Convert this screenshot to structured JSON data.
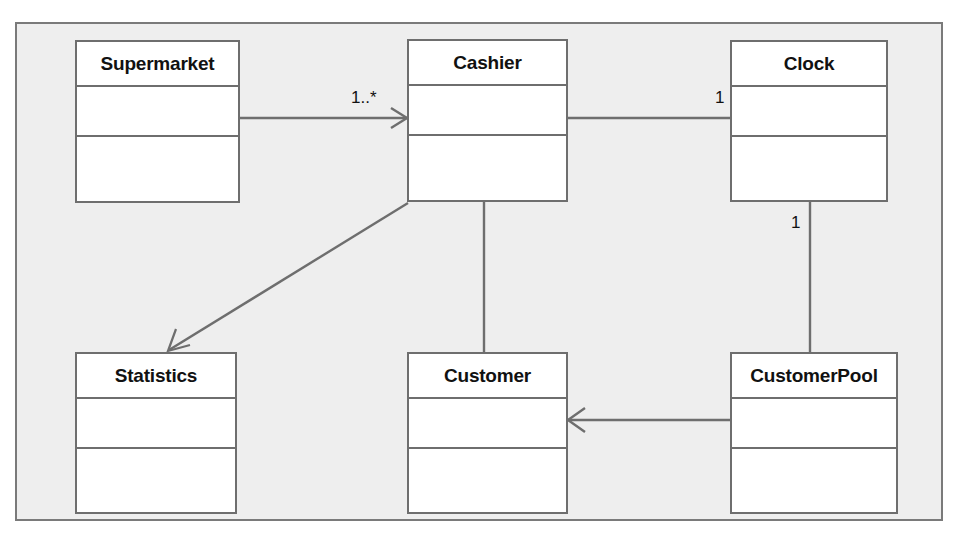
{
  "diagram": {
    "type": "uml-class-diagram",
    "frame_color": "#7a7a7a",
    "background_color": "#eeeeee",
    "box_fill_color": "#ffffff",
    "box_border_color": "#6e6e6e",
    "line_color": "#6e6e6e",
    "classes": [
      {
        "id": "supermarket",
        "name": "Supermarket",
        "attributes": [],
        "operations": []
      },
      {
        "id": "cashier",
        "name": "Cashier",
        "attributes": [],
        "operations": []
      },
      {
        "id": "clock",
        "name": "Clock",
        "attributes": [],
        "operations": []
      },
      {
        "id": "statistics",
        "name": "Statistics",
        "attributes": [],
        "operations": []
      },
      {
        "id": "customer",
        "name": "Customer",
        "attributes": [],
        "operations": []
      },
      {
        "id": "customerpool",
        "name": "CustomerPool",
        "attributes": [],
        "operations": []
      }
    ],
    "relationships": [
      {
        "id": "supermarket-cashier",
        "from": "supermarket",
        "to": "cashier",
        "arrow": "open",
        "label": "1..*"
      },
      {
        "id": "cashier-clock",
        "from": "cashier",
        "to": "clock",
        "arrow": "none",
        "label": "1"
      },
      {
        "id": "clock-customerpool",
        "from": "clock",
        "to": "customerpool",
        "arrow": "none",
        "label": "1"
      },
      {
        "id": "cashier-statistics",
        "from": "cashier",
        "to": "statistics",
        "arrow": "open",
        "label": ""
      },
      {
        "id": "cashier-customer",
        "from": "cashier",
        "to": "customer",
        "arrow": "none",
        "label": ""
      },
      {
        "id": "customerpool-customer",
        "from": "customerpool",
        "to": "customer",
        "arrow": "open",
        "label": ""
      }
    ],
    "labels": {
      "supermarket_cashier_mult": "1..*",
      "cashier_clock_mult": "1",
      "clock_customerpool_mult": "1"
    }
  }
}
